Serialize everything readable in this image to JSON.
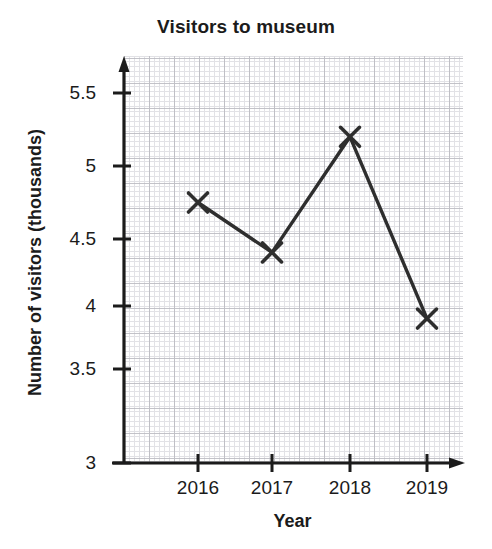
{
  "chart_data": {
    "type": "line",
    "title": "Visitors to museum",
    "xlabel": "Year",
    "ylabel": "Number of visitors (thousands)",
    "categories": [
      "2016",
      "2017",
      "2018",
      "2019"
    ],
    "values": [
      4.75,
      4.4,
      5.2,
      3.9
    ],
    "series": [
      {
        "name": "Number of visitors",
        "values": [
          4.75,
          4.4,
          5.2,
          3.9
        ]
      }
    ],
    "x": [
      2016,
      2017,
      2018,
      2019
    ],
    "ylim": [
      3,
      5.75
    ],
    "xlim": [
      2015.35,
      2019.5
    ],
    "ytick_labels": [
      "3",
      "3.5",
      "4",
      "4.5",
      "5",
      "5.5"
    ],
    "ytick_values": [
      3,
      3.5,
      4,
      4.5,
      5,
      5.5
    ],
    "xtick_labels": [
      "2016",
      "2017",
      "2018",
      "2019"
    ],
    "grid": true,
    "grid_style": "graph-paper",
    "legend": "none",
    "marker": "x-cross",
    "line_color": "#2e2e2e",
    "marker_color": "#2e2e2e",
    "grid_color": "#d9d9de",
    "axis_color": "#1b1b1b",
    "text_color": "#1b1b1b"
  },
  "axis": {
    "y_arrow": "up-arrow-icon",
    "x_arrow": "right-arrow-icon"
  }
}
